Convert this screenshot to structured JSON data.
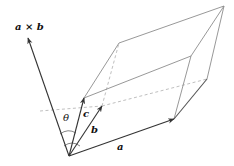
{
  "figure": {
    "labels": {
      "cross": "a × b",
      "a": "a",
      "b": "b",
      "c": "c",
      "theta": "θ"
    },
    "colors": {
      "solid_edge": "#8a8a8a",
      "dashed_edge": "#b5b5b5",
      "vector": "#333333",
      "text": "#111111"
    },
    "points": {
      "origin": [
        69,
        156
      ],
      "a": [
        174,
        119
      ],
      "b": [
        102,
        106
      ],
      "c": [
        84,
        98
      ],
      "a_plus_b": [
        207,
        79
      ],
      "a_plus_c": [
        191,
        56
      ],
      "b_plus_c": [
        119,
        43
      ],
      "a_plus_b_plus_c": [
        224,
        6
      ],
      "a_cross_b": [
        27,
        37
      ]
    }
  }
}
